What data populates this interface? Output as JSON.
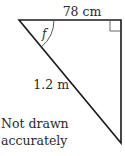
{
  "diagram": {
    "type": "right-triangle",
    "top_side_label": "78 cm",
    "hypotenuse_label": "1.2 m",
    "angle_label": "f",
    "note_line1": "Not drawn",
    "note_line2": "accurately",
    "stroke_color": "#1a1a1a"
  }
}
